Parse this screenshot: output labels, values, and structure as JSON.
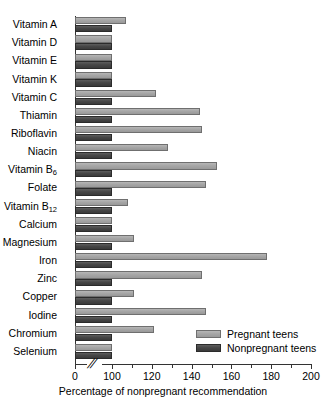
{
  "chart_data": {
    "type": "bar",
    "orientation": "horizontal",
    "title": "",
    "xlabel": "Percentage of nonpregnant recommendation",
    "ylabel": "",
    "xlim": [
      0,
      200
    ],
    "axis_break": {
      "present": true,
      "glyph": "//",
      "from": 0,
      "to": 100
    },
    "xticks": [
      0,
      100,
      120,
      140,
      160,
      180,
      200
    ],
    "xticklabels": [
      "0",
      "100",
      "120",
      "140",
      "160",
      "180",
      "200"
    ],
    "grid": false,
    "legend_position": "bottom-right",
    "categories": [
      "Vitamin A",
      "Vitamin D",
      "Vitamin E",
      "Vitamin K",
      "Vitamin C",
      "Thiamin",
      "Riboflavin",
      "Niacin",
      "Vitamin B6",
      "Folate",
      "Vitamin B12",
      "Calcium",
      "Magnesium",
      "Iron",
      "Zinc",
      "Copper",
      "Iodine",
      "Chromium",
      "Selenium"
    ],
    "categories_display": [
      {
        "text": "Vitamin A",
        "sub": ""
      },
      {
        "text": "Vitamin D",
        "sub": ""
      },
      {
        "text": "Vitamin E",
        "sub": ""
      },
      {
        "text": "Vitamin K",
        "sub": ""
      },
      {
        "text": "Vitamin C",
        "sub": ""
      },
      {
        "text": "Thiamin",
        "sub": ""
      },
      {
        "text": "Riboflavin",
        "sub": ""
      },
      {
        "text": "Niacin",
        "sub": ""
      },
      {
        "text": "Vitamin B",
        "sub": "6"
      },
      {
        "text": "Folate",
        "sub": ""
      },
      {
        "text": "Vitamin B",
        "sub": "12"
      },
      {
        "text": "Calcium",
        "sub": ""
      },
      {
        "text": "Magnesium",
        "sub": ""
      },
      {
        "text": "Iron",
        "sub": ""
      },
      {
        "text": "Zinc",
        "sub": ""
      },
      {
        "text": "Copper",
        "sub": ""
      },
      {
        "text": "Iodine",
        "sub": ""
      },
      {
        "text": "Chromium",
        "sub": ""
      },
      {
        "text": "Selenium",
        "sub": ""
      }
    ],
    "series": [
      {
        "name": "Pregnant teens",
        "color": "#a6a6a6",
        "values": [
          107,
          100,
          100,
          100,
          122,
          144,
          145,
          128,
          153,
          147,
          108,
          100,
          111,
          178,
          145,
          111,
          147,
          121,
          100
        ]
      },
      {
        "name": "Nonpregnant teens",
        "color": "#474747",
        "values": [
          100,
          100,
          100,
          100,
          100,
          100,
          100,
          100,
          100,
          100,
          100,
          100,
          100,
          100,
          100,
          100,
          100,
          100,
          100
        ]
      }
    ]
  },
  "legend": {
    "items": [
      {
        "label": "Pregnant teens",
        "color": "#a6a6a6"
      },
      {
        "label": "Nonpregnant teens",
        "color": "#474747"
      }
    ]
  },
  "axis": {
    "x_title": "Percentage of nonpregnant recommendation",
    "break_glyph": "//"
  }
}
